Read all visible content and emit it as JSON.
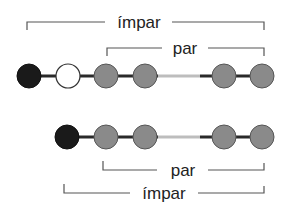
{
  "colors": {
    "black_node": "#1a1a1a",
    "white_node": "#ffffff",
    "gray_node": "#8a8a8a",
    "bond": "#2a2a2a",
    "gap_bond": "#bdbdbd",
    "bracket": "#555555"
  },
  "top_chain": {
    "nodes": [
      "black",
      "white",
      "gray",
      "gray",
      "gray",
      "gray"
    ],
    "brackets": [
      {
        "label": "ímpar"
      },
      {
        "label": "par"
      }
    ]
  },
  "bottom_chain": {
    "nodes": [
      "black",
      "gray",
      "gray",
      "gray",
      "gray"
    ],
    "brackets": [
      {
        "label": "par"
      },
      {
        "label": "ímpar"
      }
    ]
  }
}
